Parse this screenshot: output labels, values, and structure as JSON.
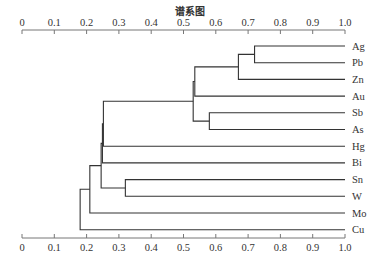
{
  "chart_data": {
    "type": "dendrogram",
    "title": "谱系图",
    "xlabel": "",
    "ylabel": "",
    "xlim": [
      0,
      1.0
    ],
    "x_ticks": [
      "0",
      "0.1",
      "0.2",
      "0.3",
      "0.4",
      "0.5",
      "0.6",
      "0.7",
      "0.8",
      "0.9",
      "1.0"
    ],
    "axis_position": [
      "top",
      "bottom"
    ],
    "grid": false,
    "leaves": [
      "Ag",
      "Pb",
      "Zn",
      "Au",
      "Sb",
      "As",
      "Hg",
      "Bi",
      "Sn",
      "W",
      "Mo",
      "Cu"
    ],
    "merges": [
      {
        "id": "c1",
        "left": "Ag",
        "right": "Pb",
        "height": 0.72
      },
      {
        "id": "c2",
        "left": "c1",
        "right": "Zn",
        "height": 0.67
      },
      {
        "id": "c3",
        "left": "c2",
        "right": "Au",
        "height": 0.535
      },
      {
        "id": "c4",
        "left": "Sb",
        "right": "As",
        "height": 0.58
      },
      {
        "id": "c5",
        "left": "c3",
        "right": "c4",
        "height": 0.53
      },
      {
        "id": "c6",
        "left": "c5",
        "right": "Hg",
        "height": 0.252
      },
      {
        "id": "c7",
        "left": "c6",
        "right": "Bi",
        "height": 0.249
      },
      {
        "id": "c8",
        "left": "Sn",
        "right": "W",
        "height": 0.32
      },
      {
        "id": "c9",
        "left": "c7",
        "right": "c8",
        "height": 0.245
      },
      {
        "id": "c10",
        "left": "c9",
        "right": "Mo",
        "height": 0.21
      },
      {
        "id": "c11",
        "left": "c10",
        "right": "Cu",
        "height": 0.18
      }
    ]
  },
  "style": {
    "line_color": "#333333",
    "text_color": "#333333"
  }
}
